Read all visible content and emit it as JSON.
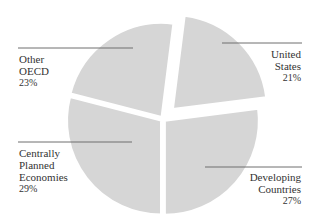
{
  "chart_data": {
    "type": "pie",
    "title": "",
    "start_angle_deg": 7.2,
    "direction": "clockwise",
    "exploded": [
      "United States"
    ],
    "slice_color": "#d6d6d6",
    "leader_color": "#6e6e6e",
    "slices": [
      {
        "name": "United States",
        "label_lines": [
          "United",
          "States"
        ],
        "value": 21,
        "value_label": "21%"
      },
      {
        "name": "Developing Countries",
        "label_lines": [
          "Developing",
          "Countries"
        ],
        "value": 27,
        "value_label": "27%"
      },
      {
        "name": "Centrally Planned Economies",
        "label_lines": [
          "Centrally",
          "Planned",
          "Economies"
        ],
        "value": 29,
        "value_label": "29%"
      },
      {
        "name": "Other OECD",
        "label_lines": [
          "Other",
          "OECD"
        ],
        "value": 23,
        "value_label": "23%"
      }
    ]
  }
}
